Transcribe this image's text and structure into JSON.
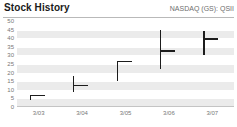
{
  "header": {
    "title": "Stock History",
    "ticker": "NASDAQ (GS): QSII"
  },
  "chart_data": {
    "type": "ohlc",
    "title": "Stock History",
    "subtitle": "NASDAQ (GS): QSII",
    "xlabel": "",
    "ylabel": "",
    "categories": [
      "3/03",
      "3/04",
      "3/05",
      "3/06",
      "3/07"
    ],
    "ylim": [
      0,
      50
    ],
    "ytick_labels": [
      "50",
      "45",
      "40",
      "35",
      "30",
      "25",
      "20",
      "15",
      "10",
      "5",
      "0"
    ],
    "ytick_values": [
      50,
      45,
      40,
      35,
      30,
      25,
      20,
      15,
      10,
      5,
      0
    ],
    "grid": true,
    "legend": false,
    "series": [
      {
        "name": "Price range",
        "points": [
          {
            "x": "3/03",
            "low": 4,
            "high": 7,
            "close": 7
          },
          {
            "x": "3/04",
            "low": 9,
            "high": 18,
            "close": 13
          },
          {
            "x": "3/05",
            "low": 15,
            "high": 27,
            "close": 27
          },
          {
            "x": "3/06",
            "low": 22,
            "high": 45,
            "close": 33
          },
          {
            "x": "3/07",
            "low": 30,
            "high": 44,
            "close": 40
          }
        ]
      }
    ],
    "colors": {
      "bar": "#1c1c1c",
      "band": "#ebebeb",
      "gridline": "#ffffff",
      "axis_text": "#777777",
      "title_text": "#1a1a1a",
      "rule": "#b9b9b9"
    }
  }
}
